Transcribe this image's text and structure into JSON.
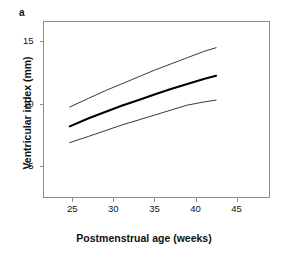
{
  "panel": {
    "label": "a"
  },
  "chart_data": {
    "type": "line",
    "title": "",
    "subtitle": "",
    "xlabel": "Postmenstrual age (weeks)",
    "ylabel": "Ventricular index (mm)",
    "xlim": [
      21.5,
      49
    ],
    "ylim": [
      2.5,
      16.6
    ],
    "xticks": [
      25,
      30,
      35,
      40,
      45
    ],
    "xtick_labels": [
      "25",
      "30",
      "35",
      "40",
      "45"
    ],
    "yticks": [
      5,
      10,
      15
    ],
    "ytick_labels": [
      "5",
      "10",
      "15"
    ],
    "grid": false,
    "legend": "none",
    "x_range_of_data": [
      24.7,
      42.5
    ],
    "series": [
      {
        "name": "upper reference limit",
        "style": "thin",
        "color": "#222222",
        "x": [
          24.7,
          27.0,
          29.0,
          31.0,
          33.0,
          35.0,
          37.0,
          39.0,
          41.0,
          42.5
        ],
        "values": [
          9.75,
          10.45,
          11.05,
          11.6,
          12.15,
          12.7,
          13.2,
          13.7,
          14.2,
          14.5
        ]
      },
      {
        "name": "median",
        "style": "bold",
        "color": "#000000",
        "x": [
          24.7,
          27.0,
          29.0,
          31.0,
          33.0,
          35.0,
          37.0,
          39.0,
          41.0,
          42.5
        ],
        "values": [
          8.2,
          8.85,
          9.35,
          9.85,
          10.3,
          10.75,
          11.2,
          11.6,
          12.0,
          12.25
        ]
      },
      {
        "name": "lower reference limit",
        "style": "thin",
        "color": "#222222",
        "x": [
          24.7,
          27.0,
          29.0,
          31.0,
          33.0,
          35.0,
          37.0,
          39.0,
          41.0,
          42.5
        ],
        "values": [
          6.9,
          7.4,
          7.85,
          8.3,
          8.7,
          9.1,
          9.5,
          9.9,
          10.15,
          10.3
        ]
      }
    ],
    "colors": {
      "axis": "#8d8d8d",
      "median_line": "#000000",
      "limit_line": "#222222",
      "background": "#ffffff"
    }
  }
}
